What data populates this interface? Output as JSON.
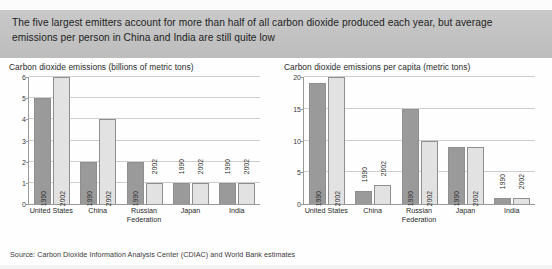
{
  "banner": {
    "headline": "The five largest emitters account for more than half of all carbon dioxide produced each year, but average emissions per person in China and India are still quite low"
  },
  "source": {
    "text": "Source: Carbon Dioxide Information Analysis Center (CDIAC) and World Bank estimates"
  },
  "colors": {
    "banner_bg": "#c4c4c4",
    "series_1990": "#9a9a9a",
    "series_2002": "#e2e2e2",
    "axis": "#9a9a9a",
    "gridline": "#cfcfcf",
    "text": "#231f20"
  },
  "chart_data": [
    {
      "type": "bar",
      "id": "total-emissions",
      "title": "Carbon dioxide emissions (billions of metric tons)",
      "xlabel": "",
      "ylabel": "",
      "ylim": [
        0,
        6
      ],
      "yticks": [
        0,
        1,
        2,
        3,
        4,
        5,
        6
      ],
      "grid": true,
      "legend": "none",
      "categories": [
        "United States",
        "China",
        "Russian Federation",
        "Japan",
        "India"
      ],
      "series": [
        {
          "name": "1990",
          "values": [
            5,
            2,
            2,
            1,
            1
          ]
        },
        {
          "name": "2002",
          "values": [
            6,
            4,
            1,
            1,
            1
          ]
        }
      ]
    },
    {
      "type": "bar",
      "id": "per-capita-emissions",
      "title": "Carbon dioxide emissions per capita (metric tons)",
      "xlabel": "",
      "ylabel": "",
      "ylim": [
        0,
        20
      ],
      "yticks": [
        0,
        5,
        10,
        15,
        20
      ],
      "grid": true,
      "legend": "none",
      "categories": [
        "United States",
        "China",
        "Russian Federation",
        "Japan",
        "India"
      ],
      "series": [
        {
          "name": "1990",
          "values": [
            19,
            2,
            15,
            9,
            1
          ]
        },
        {
          "name": "2002",
          "values": [
            20,
            3,
            10,
            9,
            1
          ]
        }
      ]
    }
  ]
}
